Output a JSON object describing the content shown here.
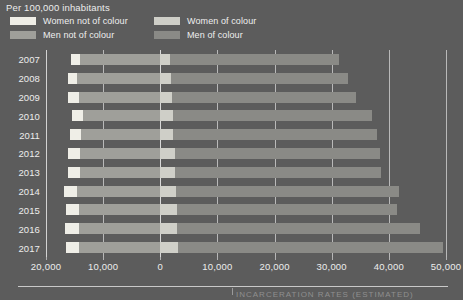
{
  "header": {
    "unit_label": "Per 100,000 inhabitants"
  },
  "legend": {
    "items": [
      {
        "label": "Women not of colour",
        "color": "#efeee7",
        "column": "left"
      },
      {
        "label": "Men not of colour",
        "color": "#9f9f9a",
        "column": "left"
      },
      {
        "label": "Women of colour",
        "color": "#cfcfc8",
        "column": "right"
      },
      {
        "label": "Men of colour",
        "color": "#8a8a86",
        "column": "right"
      }
    ]
  },
  "chart_data": {
    "type": "bar",
    "orientation": "horizontal-diverging-stacked",
    "title": "Per 100,000 inhabitants",
    "xlabel": "",
    "ylabel": "",
    "grid": true,
    "legend_position": "top",
    "xlim": [
      -20000,
      50000
    ],
    "xticks": [
      -20000,
      -10000,
      0,
      10000,
      20000,
      30000,
      40000,
      50000
    ],
    "xticklabels": [
      "20,000",
      "10,000",
      "0",
      "10,000",
      "20,000",
      "30,000",
      "40,000",
      "50,000"
    ],
    "categories": [
      "2007",
      "2008",
      "2009",
      "2010",
      "2011",
      "2012",
      "2013",
      "2014",
      "2015",
      "2016",
      "2017"
    ],
    "series": [
      {
        "name": "Men not of colour",
        "color": "#9f9f9a",
        "values": [
          -14100,
          -14500,
          -14300,
          -13600,
          -13800,
          -14000,
          -14100,
          -14600,
          -14200,
          -14300,
          -14200
        ]
      },
      {
        "name": "Women not of colour",
        "color": "#efeee7",
        "values": [
          -1600,
          -1700,
          -1800,
          -1900,
          -2000,
          -2100,
          -2100,
          -2200,
          -2300,
          -2300,
          -2300
        ]
      },
      {
        "name": "Women of colour",
        "color": "#cfcfc8",
        "values": [
          1700,
          1900,
          2000,
          2200,
          2300,
          2500,
          2500,
          2700,
          2900,
          3000,
          3100
        ]
      },
      {
        "name": "Men of colour",
        "color": "#8a8a86",
        "values": [
          29600,
          31000,
          32200,
          34800,
          35700,
          36000,
          36100,
          39000,
          38500,
          42400,
          46400
        ]
      }
    ],
    "bar_totals_right": [
      31300,
      32900,
      34200,
      37000,
      38000,
      38500,
      38600,
      41700,
      41400,
      45400,
      49500
    ],
    "bar_totals_left": [
      -15700,
      -16200,
      -16100,
      -15500,
      -15800,
      -16100,
      -16200,
      -16800,
      -16500,
      -16600,
      -16500
    ]
  },
  "footer": {
    "caption": "INCARCERATION RATES (ESTIMATED)"
  },
  "colors": {
    "background": "#5c5c5c",
    "text": "#ededed",
    "grid": "#d8d8d8",
    "axis": "#cfcfcf"
  }
}
